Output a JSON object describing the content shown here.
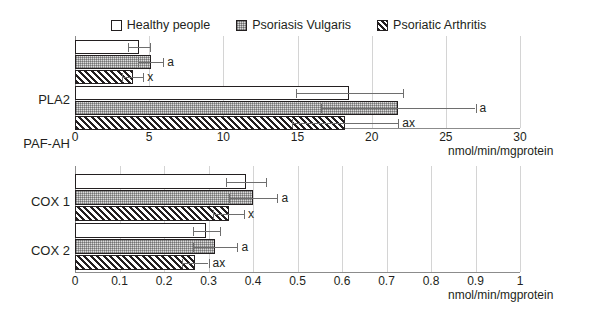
{
  "legend": {
    "items": [
      {
        "label": "Healthy people",
        "icon": "square-open-swatch",
        "key": "healthy"
      },
      {
        "label": "Psoriasis Vulgaris",
        "icon": "square-dotted-swatch",
        "key": "vulgaris"
      },
      {
        "label": "Psoriatic Arthritis",
        "icon": "square-hatched-swatch",
        "key": "arthritis"
      }
    ]
  },
  "chart_data": [
    {
      "type": "bar",
      "orientation": "horizontal",
      "panel": "top",
      "title": "",
      "xlabel": "nmol/min/mgprotein",
      "ylabel": "",
      "xlim": [
        0,
        30
      ],
      "xticks": [
        "0",
        "5",
        "10",
        "15",
        "20",
        "25",
        "30"
      ],
      "xtickvalues": [
        0,
        5,
        10,
        15,
        20,
        25,
        30
      ],
      "grid": true,
      "categories": [
        "PLA2",
        "PAF-AH"
      ],
      "series": [
        {
          "name": "Healthy people",
          "values": [
            4.3,
            18.5
          ],
          "errors": [
            0.75,
            3.6
          ]
        },
        {
          "name": "Psoriasis Vulgaris",
          "values": [
            5.1,
            21.8
          ],
          "errors": [
            0.85,
            5.2
          ]
        },
        {
          "name": "Psoriatic Arthritis",
          "values": [
            3.9,
            18.2
          ],
          "errors": [
            0.7,
            3.6
          ]
        }
      ],
      "annotations": [
        {
          "category": "PLA2",
          "series": "Psoriasis Vulgaris",
          "text": "a"
        },
        {
          "category": "PLA2",
          "series": "Psoriatic Arthritis",
          "text": "x"
        },
        {
          "category": "PAF-AH",
          "series": "Psoriasis Vulgaris",
          "text": "a"
        },
        {
          "category": "PAF-AH",
          "series": "Psoriatic Arthritis",
          "text": "ax"
        }
      ]
    },
    {
      "type": "bar",
      "orientation": "horizontal",
      "panel": "bottom",
      "title": "",
      "xlabel": "nmol/min/mgprotein",
      "ylabel": "",
      "xlim": [
        0,
        1
      ],
      "xticks": [
        "0",
        "0.1",
        "0.2",
        "0.3",
        "0.4",
        "0.5",
        "0.6",
        "0.7",
        "0.8",
        "0.9",
        "1"
      ],
      "xtickvalues": [
        0,
        0.1,
        0.2,
        0.3,
        0.4,
        0.5,
        0.6,
        0.7,
        0.8,
        0.9,
        1
      ],
      "grid": true,
      "categories": [
        "COX 1",
        "COX 2"
      ],
      "series": [
        {
          "name": "Healthy people",
          "values": [
            0.385,
            0.295
          ],
          "errors": [
            0.045,
            0.03
          ]
        },
        {
          "name": "Psoriasis Vulgaris",
          "values": [
            0.4,
            0.315
          ],
          "errors": [
            0.055,
            0.05
          ]
        },
        {
          "name": "Psoriatic Arthritis",
          "values": [
            0.345,
            0.27
          ],
          "errors": [
            0.035,
            0.03
          ]
        }
      ],
      "annotations": [
        {
          "category": "COX 1",
          "series": "Psoriasis Vulgaris",
          "text": "a"
        },
        {
          "category": "COX 1",
          "series": "Psoriatic Arthritis",
          "text": "x"
        },
        {
          "category": "COX 2",
          "series": "Psoriasis Vulgaris",
          "text": "a"
        },
        {
          "category": "COX 2",
          "series": "Psoriatic Arthritis",
          "text": "ax"
        }
      ]
    }
  ],
  "top": {
    "groups": [
      {
        "label": "PLA2"
      },
      {
        "label": "PAF-AH"
      }
    ],
    "ticks": [
      "0",
      "5",
      "10",
      "15",
      "20",
      "25",
      "30"
    ],
    "unit": "nmol/min/mgprotein",
    "sig": {
      "pla2_a": "a",
      "pla2_x": "x",
      "paf_a": "a",
      "paf_ax": "ax"
    }
  },
  "bottom": {
    "groups": [
      {
        "label": "COX 1"
      },
      {
        "label": "COX 2"
      }
    ],
    "ticks": [
      "0",
      "0.1",
      "0.2",
      "0.3",
      "0.4",
      "0.5",
      "0.6",
      "0.7",
      "0.8",
      "0.9",
      "1"
    ],
    "unit": "nmol/min/mgprotein",
    "sig": {
      "cox1_a": "a",
      "cox1_x": "x",
      "cox2_a": "a",
      "cox2_ax": "ax"
    }
  },
  "colors": {
    "ink": "#231f20",
    "grid": "#d4d4d4",
    "axis": "#8c8c8c",
    "error": "#6e6e6e",
    "vulgaris_fill": "#dcdcdc"
  }
}
